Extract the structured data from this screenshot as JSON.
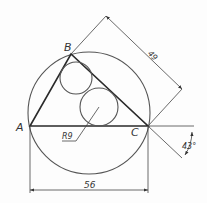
{
  "drawing": {
    "points": {
      "A": "A",
      "B": "B",
      "C": "C"
    },
    "dimensions": {
      "base_length": "56",
      "side_length": "49",
      "radius": "R9",
      "angle": "43°"
    },
    "colors": {
      "line": "#2a2a2a",
      "background": "#fdfdfd"
    }
  }
}
